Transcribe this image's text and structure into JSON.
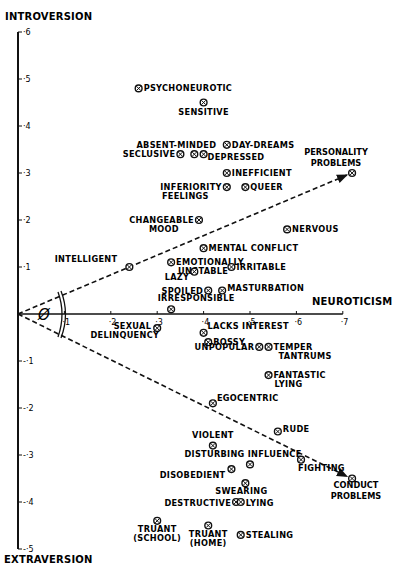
{
  "chart_data": {
    "type": "scatter",
    "title": "",
    "xlabel": "NEUROTICISM",
    "ylabel_top": "INTROVERSION",
    "ylabel_bottom": "EXTRAVERSION",
    "xlim": [
      0,
      0.7
    ],
    "ylim": [
      -0.5,
      0.6
    ],
    "x_ticks": [
      "·1",
      "·2",
      "·3",
      "·4",
      "·5",
      "·6",
      "·7"
    ],
    "y_ticks": [
      "·6",
      "·5",
      "·4",
      "·3",
      "·2",
      "·1",
      "-·1",
      "-·2",
      "-·3",
      "-·4",
      "-·5"
    ],
    "grid": false,
    "angle_label": "Ø",
    "vectors": [
      {
        "name": "PERSONALITY PROBLEMS",
        "x": 0.72,
        "y": 0.3
      },
      {
        "name": "CONDUCT PROBLEMS",
        "x": 0.72,
        "y": -0.35
      }
    ],
    "points": [
      {
        "label": "PSYCHONEUROTIC",
        "x": 0.26,
        "y": 0.48
      },
      {
        "label": "SENSITIVE",
        "x": 0.4,
        "y": 0.45
      },
      {
        "label": "ABSENT-MINDED",
        "x": 0.38,
        "y": 0.34
      },
      {
        "label": "SECLUSIVE",
        "x": 0.35,
        "y": 0.34
      },
      {
        "label": "DAY-DREAMS",
        "x": 0.45,
        "y": 0.36
      },
      {
        "label": "DEPRESSED",
        "x": 0.4,
        "y": 0.34
      },
      {
        "label": "INEFFICIENT",
        "x": 0.45,
        "y": 0.3
      },
      {
        "label": "INFERIORITY FEELINGS",
        "x": 0.45,
        "y": 0.27
      },
      {
        "label": "QUEER",
        "x": 0.49,
        "y": 0.27
      },
      {
        "label": "CHANGEABLE MOOD",
        "x": 0.39,
        "y": 0.2
      },
      {
        "label": "NERVOUS",
        "x": 0.58,
        "y": 0.18
      },
      {
        "label": "MENTAL CONFLICT",
        "x": 0.4,
        "y": 0.14
      },
      {
        "label": "INTELLIGENT",
        "x": 0.24,
        "y": 0.1
      },
      {
        "label": "EMOTIONALLY UNSTABLE",
        "x": 0.33,
        "y": 0.11
      },
      {
        "label": "IRRITABLE",
        "x": 0.46,
        "y": 0.1
      },
      {
        "label": "LAZY",
        "x": 0.38,
        "y": 0.09
      },
      {
        "label": "SPOILED",
        "x": 0.41,
        "y": 0.05
      },
      {
        "label": "MASTURBATION",
        "x": 0.44,
        "y": 0.05
      },
      {
        "label": "IRRESPONSIBLE",
        "x": 0.33,
        "y": 0.01
      },
      {
        "label": "SEXUAL DELINQUENCY",
        "x": 0.3,
        "y": -0.03
      },
      {
        "label": "LACKS INTEREST",
        "x": 0.4,
        "y": -0.04
      },
      {
        "label": "BOSSY",
        "x": 0.41,
        "y": -0.06
      },
      {
        "label": "UNPOPULAR",
        "x": 0.52,
        "y": -0.07
      },
      {
        "label": "TEMPER TANTRUMS",
        "x": 0.54,
        "y": -0.07
      },
      {
        "label": "FANTASTIC LYING",
        "x": 0.54,
        "y": -0.13
      },
      {
        "label": "EGOCENTRIC",
        "x": 0.42,
        "y": -0.19
      },
      {
        "label": "RUDE",
        "x": 0.56,
        "y": -0.25
      },
      {
        "label": "VIOLENT",
        "x": 0.42,
        "y": -0.28
      },
      {
        "label": "DISTURBING INFLUENCE",
        "x": 0.5,
        "y": -0.32
      },
      {
        "label": "DISOBEDIENT",
        "x": 0.46,
        "y": -0.33
      },
      {
        "label": "FIGHTING",
        "x": 0.61,
        "y": -0.31
      },
      {
        "label": "SWEARING",
        "x": 0.49,
        "y": -0.36
      },
      {
        "label": "DESTRUCTIVE",
        "x": 0.47,
        "y": -0.4
      },
      {
        "label": "LYING",
        "x": 0.48,
        "y": -0.4
      },
      {
        "label": "TRUANT (SCHOOL)",
        "x": 0.3,
        "y": -0.44
      },
      {
        "label": "TRUANT (HOME)",
        "x": 0.41,
        "y": -0.45
      },
      {
        "label": "STEALING",
        "x": 0.48,
        "y": -0.47
      }
    ]
  },
  "ui": {
    "ylabel_top": "INTROVERSION",
    "ylabel_bottom": "EXTRAVERSION",
    "xlabel": "NEUROTICISM",
    "angle_label": "Ø",
    "colors": {
      "ink": "#111111",
      "paper": "#ffffff"
    }
  }
}
